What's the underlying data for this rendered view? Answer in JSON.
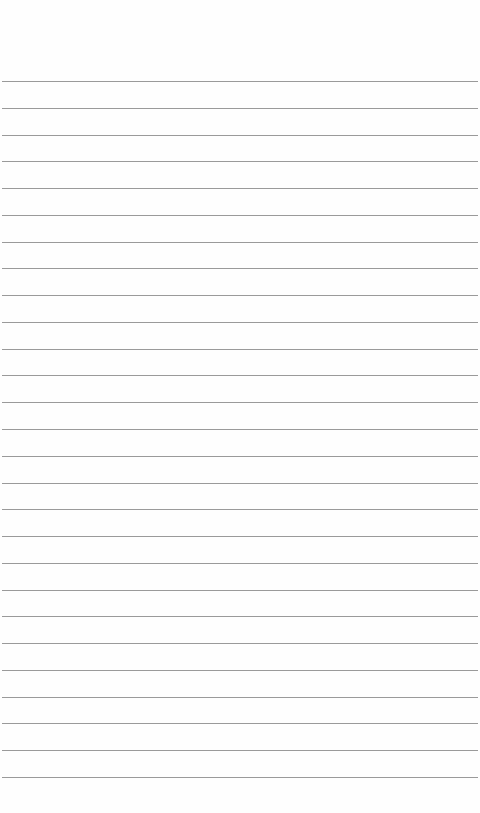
{
  "page": {
    "type": "lined-paper",
    "background_color": "#fefefe",
    "line_color": "#9a9a9a",
    "line_count": 27,
    "first_line_y": 81,
    "line_spacing": 26.77
  }
}
